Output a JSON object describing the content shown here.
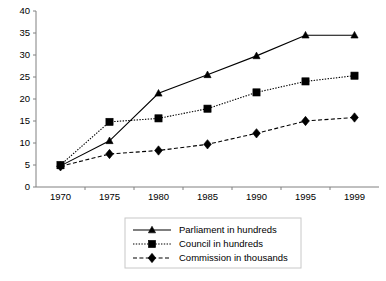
{
  "chart_data": {
    "type": "line",
    "title": "",
    "xlabel": "",
    "ylabel": "",
    "categories": [
      "1970",
      "1975",
      "1980",
      "1985",
      "1990",
      "1995",
      "1999"
    ],
    "x": [
      1970,
      1975,
      1980,
      1985,
      1990,
      1995,
      1999
    ],
    "ylim": [
      0,
      40
    ],
    "yticks": [
      0,
      5,
      10,
      15,
      20,
      25,
      30,
      35,
      40
    ],
    "ytick_labels": [
      "0",
      "5",
      "10",
      "15",
      "20",
      "25",
      "30",
      "35",
      "40"
    ],
    "grid": false,
    "legend_position": "bottom-center",
    "series": [
      {
        "name": "Parliament in hundreds",
        "marker": "triangle",
        "line_style": "solid",
        "color": "#000000",
        "values": [
          4.8,
          10.5,
          21.3,
          25.5,
          29.8,
          34.5,
          34.5
        ]
      },
      {
        "name": "Council in hundreds",
        "marker": "square",
        "line_style": "dotted",
        "color": "#000000",
        "values": [
          5.0,
          14.8,
          15.6,
          17.8,
          21.5,
          24.0,
          25.3
        ]
      },
      {
        "name": "Commission in thousands",
        "marker": "diamond",
        "line_style": "dashed",
        "color": "#000000",
        "values": [
          4.7,
          7.5,
          8.3,
          9.7,
          12.2,
          15.0,
          15.8
        ]
      }
    ]
  },
  "legend": {
    "entries": [
      {
        "label": "Parliament in hundreds"
      },
      {
        "label": "Council in hundreds"
      },
      {
        "label": "Commission in thousands"
      }
    ]
  }
}
